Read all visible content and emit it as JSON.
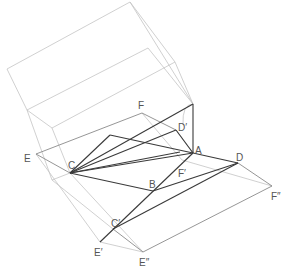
{
  "diagram": {
    "type": "geometric-construction",
    "labels": {
      "E": "E",
      "F": "F",
      "D_prime": "D′",
      "C": "C",
      "A": "A",
      "D": "D",
      "F_prime": "F′",
      "B": "B",
      "F_double_prime": "F″",
      "C_prime": "C′",
      "E_prime": "E′",
      "E_double_prime": "E″"
    },
    "colors": {
      "background": "#ffffff",
      "construction_line": "#c4c4c4",
      "secondary_line": "#8a8a8a",
      "primary_line": "#3a3a3a",
      "label": "#555555"
    }
  }
}
